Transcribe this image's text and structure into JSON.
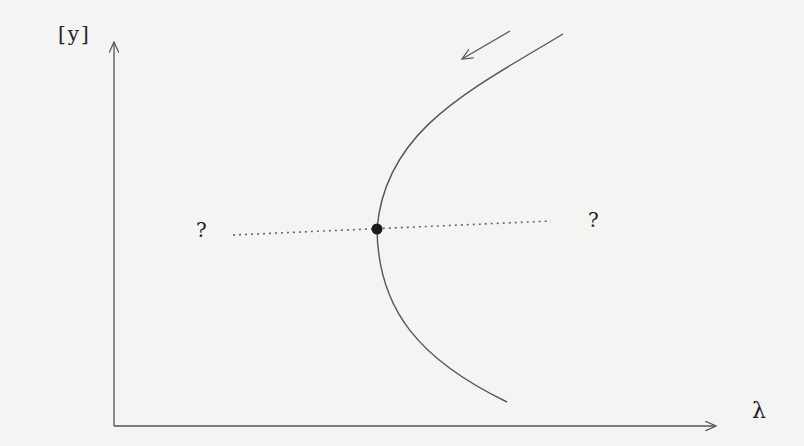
{
  "diagram": {
    "type": "bifurcation-diagram",
    "axes": {
      "y_label": "[y]",
      "x_label": "λ",
      "origin": [
        114,
        426
      ],
      "y_axis_top": [
        114,
        40
      ],
      "x_axis_right": [
        716,
        426
      ]
    },
    "curve": {
      "description": "fold / saddle-node branch opening to the right",
      "top_end": [
        563,
        34
      ],
      "turning_point": [
        377,
        229
      ],
      "bottom_end": [
        507,
        402
      ]
    },
    "fold_point": {
      "marker": "filled-circle",
      "position": [
        377,
        229
      ]
    },
    "dotted_line": {
      "start": [
        233,
        235
      ],
      "end": [
        551,
        221
      ]
    },
    "direction_arrow": {
      "from": [
        510,
        31
      ],
      "to": [
        461,
        60
      ]
    },
    "labels": {
      "left_question": "?",
      "right_question": "?"
    },
    "colors": {
      "line": "#555555",
      "dot": "#1a1a1a",
      "background": "#f4f4f2"
    }
  }
}
